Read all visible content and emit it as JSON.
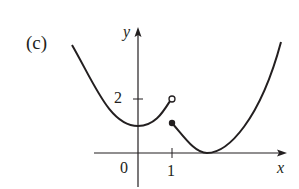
{
  "figure": {
    "panel_label": "(c)",
    "x_axis_label": "x",
    "y_axis_label": "y",
    "x_ticks": [
      "0",
      "1"
    ],
    "y_ticks": [
      "2"
    ],
    "line_color": "#231f20",
    "background_color": "#ffffff"
  },
  "graph": {
    "description": "Piecewise function with jump discontinuity at x = 1",
    "left_piece": {
      "shape": "upward parabola",
      "minimum_at": [
        0,
        1
      ],
      "ends_at": [
        1,
        2
      ],
      "endpoint": "open circle"
    },
    "right_piece": {
      "shape": "upward parabola",
      "starts_at": [
        1,
        1
      ],
      "start_point": "filled dot",
      "minimum_at": [
        2,
        0
      ]
    }
  }
}
